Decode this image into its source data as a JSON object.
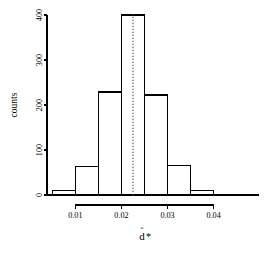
{
  "chart_data": {
    "type": "bar",
    "subtype": "histogram",
    "title": "",
    "xlabel": "d̂*",
    "ylabel": "counts",
    "xlabel_parts": {
      "base": "d",
      "hat": "ˆ",
      "star": "*"
    },
    "bin_edges": [
      0.005,
      0.01,
      0.015,
      0.02,
      0.025,
      0.03,
      0.035,
      0.04,
      0.045
    ],
    "bin_centers": [
      0.0075,
      0.0125,
      0.0175,
      0.0225,
      0.0275,
      0.0325,
      0.0375,
      0.0425
    ],
    "categories": [
      "0.005-0.010",
      "0.010-0.015",
      "0.015-0.020",
      "0.020-0.025",
      "0.025-0.030",
      "0.030-0.035",
      "0.035-0.040",
      "0.040-0.045"
    ],
    "values": [
      10,
      63,
      229,
      400,
      222,
      65,
      10,
      1
    ],
    "bar_fill": "#ffffff",
    "bar_stroke": "#000000",
    "bar_stroke_width": 1.4,
    "xlim": [
      0.0045,
      0.0455
    ],
    "ylim": [
      0,
      400
    ],
    "grid": false,
    "legend": "none",
    "xticks": [
      0.01,
      0.02,
      0.03,
      0.04
    ],
    "xticklabels": [
      "0.01",
      "0.02",
      "0.03",
      "0.04"
    ],
    "yticks": [
      0,
      100,
      200,
      300,
      400
    ],
    "yticklabels": [
      "0",
      "100",
      "200",
      "300",
      "400"
    ],
    "annotations": [
      {
        "name": "mean-reference-line",
        "type": "vline",
        "x": 0.0225,
        "style": "dotted",
        "color": "#555555",
        "width": 1.2
      }
    ],
    "axis_color": "#000000",
    "axis_line_width": 1.2
  },
  "axes": {
    "y_label": "counts",
    "x_tick_labels": [
      "0.01",
      "0.02",
      "0.03",
      "0.04"
    ],
    "y_tick_labels": [
      "0",
      "100",
      "200",
      "300",
      "400"
    ]
  }
}
